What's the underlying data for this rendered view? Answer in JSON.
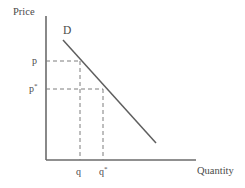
{
  "figure": {
    "type": "economics-demand-curve-diagram",
    "background": "#ffffff",
    "line_color": "#6b6b6b",
    "text_color": "#4a4a4a",
    "axes": {
      "y_label": "Price",
      "x_label": "Quantity",
      "origin": {
        "x": 46,
        "y": 160
      },
      "y_axis_top": {
        "x": 46,
        "y": 16
      },
      "x_axis_right": {
        "x": 196,
        "y": 160
      }
    },
    "curve": {
      "label": "D",
      "name": "demand-curve",
      "start": {
        "x": 63,
        "y": 40
      },
      "end": {
        "x": 156,
        "y": 143
      }
    },
    "price_markers": [
      {
        "id": "p",
        "label": "p",
        "has_star": false,
        "y": 61
      },
      {
        "id": "p-star",
        "label": "p",
        "has_star": true,
        "y": 89
      }
    ],
    "quantity_markers": [
      {
        "id": "q",
        "label": "q",
        "has_star": false,
        "x": 80
      },
      {
        "id": "q-star",
        "label": "q",
        "has_star": true,
        "x": 103
      }
    ],
    "points": [
      {
        "id": "point-q-p",
        "x": 80,
        "y": 61
      },
      {
        "id": "point-qstar-pstar",
        "x": 103,
        "y": 89
      }
    ]
  }
}
